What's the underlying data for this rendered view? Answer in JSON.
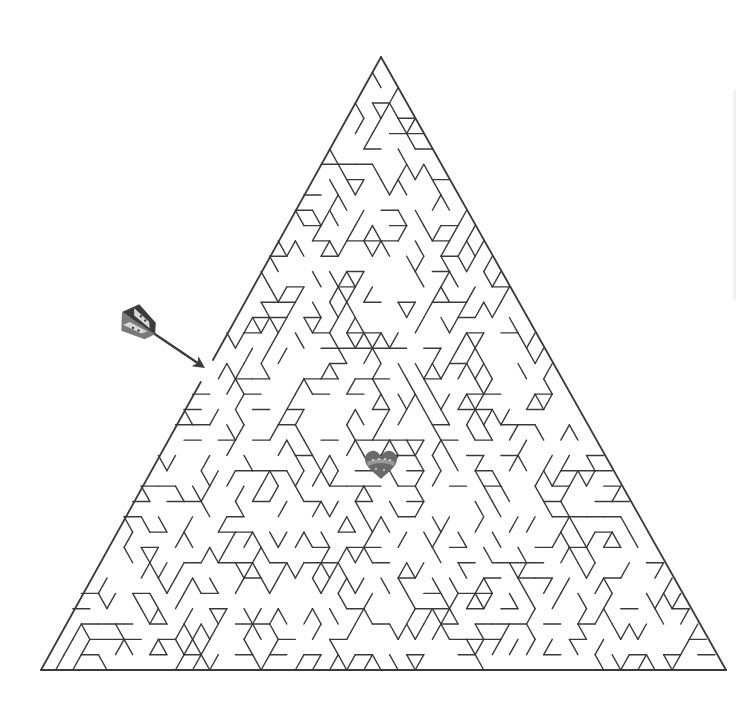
{
  "puzzle": {
    "type": "triangle-maze",
    "title": "",
    "start_marker": "arrow",
    "goal_marker": "heart"
  },
  "layout": {
    "apex": [
      381,
      57
    ],
    "bottom_left": [
      41,
      670
    ],
    "bottom_right": [
      726,
      670
    ],
    "rows": 40,
    "entrance_gap_y": [
      360,
      382
    ],
    "wall_color": "#3a3a3a",
    "wall_width": 1.4,
    "seed": 7
  },
  "arrow": {
    "tail": [
      122,
      312
    ],
    "tip": [
      205,
      368
    ],
    "colors": {
      "dark": "#3c3c3c",
      "mid": "#7a7a7a",
      "light": "#d8d8d8"
    }
  },
  "heart": {
    "center": [
      381,
      465
    ],
    "size": 30,
    "colors": {
      "fill": "#6a6a6a",
      "band": "#9a9a9a",
      "dots": "#d9d9d9"
    }
  }
}
